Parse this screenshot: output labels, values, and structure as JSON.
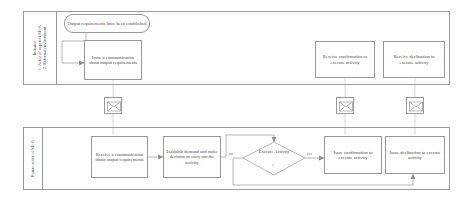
{
  "diagram": {
    "type": "cross-functional-flowchart",
    "colors": {
      "stroke": "#9a9a9a",
      "text": "#4a4a4a",
      "background": "#ffffff",
      "edge_label": "#6d6d6d"
    },
    "lanes": [
      {
        "id": "lane-initiator",
        "label": "Initiator:\n1. Actor of superior SE-A\n2. External environment"
      },
      {
        "id": "lane-future-actor",
        "label": "Future actor of SE-A"
      }
    ],
    "nodes": {
      "start_event": "Output requirements have been established",
      "issue_communication": "Issue a communication about output requirements",
      "receive_confirmation": "Receive confirmation to execute activity",
      "receive_declination": "Receive declination to execute activity",
      "receive_communication": "Receive a communication about output requirements",
      "establish_demand": "Establish demand and make decision to carry out the activity",
      "decision": "Execute Activity",
      "decision_mark": "?",
      "issue_confirmation": "Issue confirmation to execute activity",
      "issue_declination": "Issue declination to execute activity"
    },
    "edge_labels": {
      "no": "no",
      "yes": "yes"
    },
    "messages": [
      {
        "id": "message-1",
        "icon": "envelope-icon"
      },
      {
        "id": "message-2",
        "icon": "envelope-icon"
      },
      {
        "id": "message-3",
        "icon": "envelope-icon"
      }
    ]
  }
}
